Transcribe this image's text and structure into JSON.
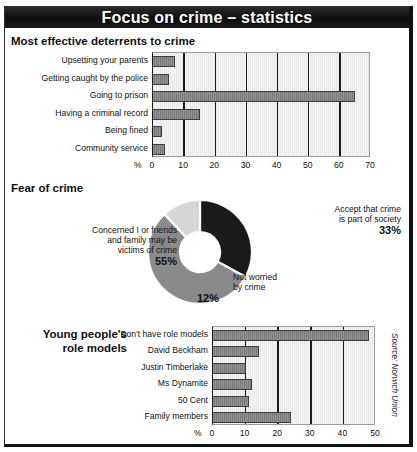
{
  "page": {
    "top_bleed_text": "∙∙                              ∙"
  },
  "header": {
    "title": "Focus on crime – statistics",
    "bar_color": "#121212",
    "text_color": "#ffffff"
  },
  "source_credit": "Source: Norwich Union",
  "sections": {
    "deterrents": {
      "heading": "Most effective deterrents to crime"
    },
    "fear": {
      "heading": "Fear of crime"
    },
    "role_models": {
      "heading_line1": "Young people's",
      "heading_line2": "role models"
    }
  },
  "colors": {
    "bar_fill": "#7f7f7f",
    "bar_stroke": "#3b3b3b",
    "plot_bg": "#e9e9e9",
    "gridline": "#1c1c1c",
    "slice_dark": "#1a1a1a",
    "slice_mid": "#8a8a8a",
    "slice_light": "#d6d6d6"
  },
  "chart_data": [
    {
      "id": "deterrents",
      "type": "bar",
      "orientation": "horizontal",
      "title": "Most effective deterrents to crime",
      "xlabel": "%",
      "ylabel": "",
      "xlim": [
        0,
        70
      ],
      "ticks": [
        "0",
        "10",
        "20",
        "30",
        "40",
        "50",
        "60",
        "70"
      ],
      "tick_values": [
        0,
        10,
        20,
        30,
        40,
        50,
        60,
        70
      ],
      "grid": true,
      "categories": [
        "Upsetting your parents",
        "Getting caught by the police",
        "Going to prison",
        "Having a criminal record",
        "Being fined",
        "Community service"
      ],
      "values": [
        7,
        5,
        65,
        15,
        3,
        4
      ]
    },
    {
      "id": "fear-of-crime",
      "type": "pie",
      "variant": "donut",
      "title": "Fear of crime",
      "labels": [
        "Accept that crime is part of society",
        "Concerned I or friends and family may be victims of crime",
        "Not worried by crime"
      ],
      "label_lines": [
        [
          "Accept that crime",
          "is part of society"
        ],
        [
          "Concerned I or friends",
          "and family may be",
          "victims of crime"
        ],
        [
          "Not worried",
          "by crime"
        ]
      ],
      "values": [
        33,
        55,
        12
      ],
      "value_labels": [
        "33%",
        "55%",
        "12%"
      ],
      "slice_colors": [
        "#1a1a1a",
        "#8a8a8a",
        "#d6d6d6"
      ]
    },
    {
      "id": "role-models",
      "type": "bar",
      "orientation": "horizontal",
      "title": "Young people's role models",
      "xlabel": "%",
      "ylabel": "",
      "xlim": [
        0,
        50
      ],
      "ticks": [
        "0",
        "10",
        "20",
        "30",
        "40",
        "50"
      ],
      "tick_values": [
        0,
        10,
        20,
        30,
        40,
        50
      ],
      "grid": true,
      "categories": [
        "Don't have role models",
        "David Beckham",
        "Justin Timberlake",
        "Ms Dynamite",
        "50 Cent",
        "Family members"
      ],
      "values": [
        48,
        14,
        10,
        12,
        11,
        24
      ]
    }
  ]
}
